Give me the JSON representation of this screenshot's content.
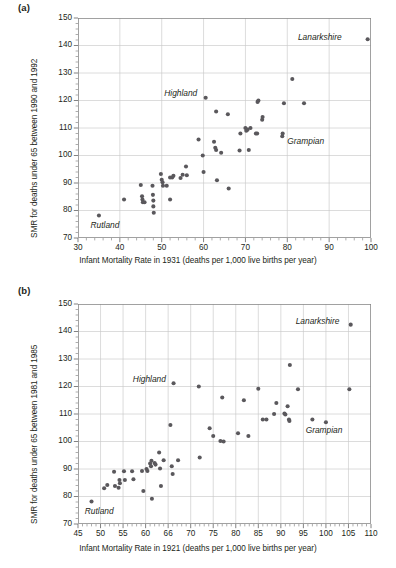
{
  "figure": {
    "panels": [
      {
        "key": "a",
        "label": "(a)",
        "xlabel": "Infant Mortality Rate in 1931 (deaths per 1,000 live births per year)",
        "ylabel": "SMR for deaths under 65 between 1990 and 1992",
        "xticks": [
          "30",
          "40",
          "50",
          "60",
          "70",
          "80",
          "90",
          "100"
        ],
        "yticks": [
          "70",
          "80",
          "90",
          "100",
          "110",
          "120",
          "130",
          "140",
          "150"
        ],
        "annotations": [
          {
            "text": "Lanarkshire"
          },
          {
            "text": "Highland"
          },
          {
            "text": "Grampian"
          },
          {
            "text": "Rutland"
          }
        ]
      },
      {
        "key": "b",
        "label": "(b)",
        "xlabel": "Infant Mortality Rate in 1921 (deaths per 1,000 live births per year)",
        "ylabel": "SMR for deaths under 65 between 1981 and 1985",
        "xticks": [
          "45",
          "50",
          "55",
          "60",
          "66",
          "70",
          "75",
          "80",
          "85",
          "90",
          "95",
          "100",
          "105",
          "110"
        ],
        "yticks": [
          "70",
          "80",
          "90",
          "100",
          "110",
          "120",
          "130",
          "140",
          "150"
        ],
        "annotations": [
          {
            "text": "Lanarkshire"
          },
          {
            "text": "Highland"
          },
          {
            "text": "Grampian"
          },
          {
            "text": "Rutland"
          }
        ]
      }
    ]
  },
  "chart_data": [
    {
      "type": "scatter",
      "panel": "a",
      "title": "(a)",
      "xlabel": "Infant Mortality Rate in 1931 (deaths per 1,000 live births per year)",
      "ylabel": "SMR for deaths under 65 between 1990 and 1992",
      "xlim": [
        30,
        100
      ],
      "ylim": [
        70,
        150
      ],
      "xtick_values": [
        30,
        40,
        50,
        60,
        70,
        80,
        90,
        100
      ],
      "xtick_labels": [
        "30",
        "40",
        "50",
        "60",
        "70",
        "80",
        "90",
        "100"
      ],
      "ytick_values": [
        70,
        80,
        90,
        100,
        110,
        120,
        130,
        140,
        150
      ],
      "ytick_labels": [
        "70",
        "80",
        "90",
        "100",
        "110",
        "120",
        "130",
        "140",
        "150"
      ],
      "x_minor_interval": 2,
      "y_minor_interval": 2,
      "grid": true,
      "legend": false,
      "marker_color": "#5a585c",
      "points": [
        [
          35.0,
          78.2
        ],
        [
          41.0,
          84.0
        ],
        [
          45.0,
          89.3
        ],
        [
          45.3,
          85.2
        ],
        [
          45.4,
          84.0
        ],
        [
          45.5,
          83.0
        ],
        [
          45.9,
          83.0
        ],
        [
          47.8,
          89.0
        ],
        [
          47.9,
          85.7
        ],
        [
          48.0,
          83.6
        ],
        [
          48.0,
          81.5
        ],
        [
          48.1,
          79.2
        ],
        [
          49.8,
          93.3
        ],
        [
          50.0,
          91.2
        ],
        [
          50.2,
          90.3
        ],
        [
          50.3,
          89.0
        ],
        [
          51.2,
          89.0
        ],
        [
          52.0,
          92.0
        ],
        [
          52.0,
          84.0
        ],
        [
          52.5,
          92.0
        ],
        [
          52.8,
          92.6
        ],
        [
          54.5,
          91.8
        ],
        [
          55.0,
          93.0
        ],
        [
          55.8,
          96.0
        ],
        [
          56.0,
          92.8
        ],
        [
          58.8,
          105.8
        ],
        [
          59.8,
          100.0
        ],
        [
          60.0,
          94.0
        ],
        [
          60.5,
          121.0
        ],
        [
          62.5,
          105.0
        ],
        [
          62.8,
          102.8
        ],
        [
          63.0,
          102.0
        ],
        [
          63.0,
          116.0
        ],
        [
          63.2,
          91.0
        ],
        [
          64.2,
          101.0
        ],
        [
          65.8,
          115.0
        ],
        [
          66.0,
          88.0
        ],
        [
          68.6,
          101.8
        ],
        [
          68.8,
          108.0
        ],
        [
          70.0,
          110.0
        ],
        [
          70.2,
          109.0
        ],
        [
          70.5,
          109.4
        ],
        [
          70.8,
          102.0
        ],
        [
          71.2,
          110.0
        ],
        [
          72.5,
          108.0
        ],
        [
          72.8,
          108.0
        ],
        [
          72.9,
          119.5
        ],
        [
          73.1,
          120.0
        ],
        [
          74.0,
          113.0
        ],
        [
          74.1,
          114.0
        ],
        [
          78.8,
          107.0
        ],
        [
          78.9,
          108.0
        ],
        [
          79.2,
          119.0
        ],
        [
          81.2,
          127.8
        ],
        [
          84.0,
          119.0
        ],
        [
          99.2,
          142.3
        ]
      ],
      "annotations": [
        {
          "text": "Lanarkshire",
          "x": 93.0,
          "y": 143.0,
          "anchor": "end"
        },
        {
          "text": "Highland",
          "x": 58.5,
          "y": 122.5,
          "anchor": "end"
        },
        {
          "text": "Grampian",
          "x": 80.0,
          "y": 105.0,
          "anchor": "start"
        },
        {
          "text": "Rutland",
          "x": 33.0,
          "y": 74.5,
          "anchor": "start"
        }
      ]
    },
    {
      "type": "scatter",
      "panel": "b",
      "title": "(b)",
      "xlabel": "Infant Mortality Rate in 1921 (deaths per 1,000 live births per year)",
      "ylabel": "SMR for deaths under 65 between 1981 and 1985",
      "xlim": [
        45,
        110
      ],
      "ylim": [
        70,
        150
      ],
      "xtick_values": [
        45,
        50,
        55,
        60,
        65,
        70,
        75,
        80,
        85,
        90,
        95,
        100,
        105,
        110
      ],
      "xtick_labels": [
        "45",
        "50",
        "55",
        "60",
        "66",
        "70",
        "75",
        "80",
        "85",
        "90",
        "95",
        "100",
        "105",
        "110"
      ],
      "ytick_values": [
        70,
        80,
        90,
        100,
        110,
        120,
        130,
        140,
        150
      ],
      "ytick_labels": [
        "70",
        "80",
        "90",
        "100",
        "110",
        "120",
        "130",
        "140",
        "150"
      ],
      "x_minor_interval": 1,
      "y_minor_interval": 2,
      "grid": true,
      "legend": false,
      "marker_color": "#5a585c",
      "points": [
        [
          48.0,
          78.2
        ],
        [
          50.8,
          83.0
        ],
        [
          51.5,
          84.2
        ],
        [
          53.0,
          89.0
        ],
        [
          53.2,
          83.8
        ],
        [
          54.0,
          83.2
        ],
        [
          54.2,
          86.0
        ],
        [
          54.3,
          84.8
        ],
        [
          55.2,
          89.2
        ],
        [
          55.4,
          86.0
        ],
        [
          57.0,
          89.2
        ],
        [
          57.3,
          86.3
        ],
        [
          59.2,
          89.3
        ],
        [
          59.5,
          82.0
        ],
        [
          60.2,
          90.0
        ],
        [
          60.4,
          89.3
        ],
        [
          61.0,
          92.0
        ],
        [
          61.2,
          91.0
        ],
        [
          61.3,
          93.0
        ],
        [
          61.4,
          79.2
        ],
        [
          62.0,
          92.2
        ],
        [
          62.2,
          91.6
        ],
        [
          63.0,
          96.0
        ],
        [
          63.2,
          90.2
        ],
        [
          63.4,
          83.8
        ],
        [
          64.0,
          93.2
        ],
        [
          65.5,
          106.0
        ],
        [
          65.8,
          91.0
        ],
        [
          66.0,
          88.2
        ],
        [
          66.2,
          121.2
        ],
        [
          67.2,
          93.2
        ],
        [
          71.8,
          120.0
        ],
        [
          72.0,
          94.2
        ],
        [
          74.2,
          104.8
        ],
        [
          75.0,
          102.0
        ],
        [
          76.6,
          100.2
        ],
        [
          77.0,
          116.0
        ],
        [
          77.3,
          100.0
        ],
        [
          80.5,
          103.0
        ],
        [
          81.8,
          115.0
        ],
        [
          82.8,
          102.0
        ],
        [
          85.0,
          119.2
        ],
        [
          86.0,
          108.0
        ],
        [
          86.8,
          108.0
        ],
        [
          88.5,
          110.0
        ],
        [
          89.0,
          114.0
        ],
        [
          90.8,
          110.2
        ],
        [
          91.0,
          109.8
        ],
        [
          91.5,
          112.8
        ],
        [
          91.8,
          108.0
        ],
        [
          91.9,
          107.5
        ],
        [
          92.0,
          127.8
        ],
        [
          93.8,
          119.0
        ],
        [
          97.0,
          108.0
        ],
        [
          100.0,
          107.0
        ],
        [
          105.2,
          119.0
        ],
        [
          105.5,
          142.5
        ]
      ],
      "annotations": [
        {
          "text": "Lanarkshire",
          "x": 103.0,
          "y": 143.5,
          "anchor": "end"
        },
        {
          "text": "Highland",
          "x": 64.5,
          "y": 122.5,
          "anchor": "end"
        },
        {
          "text": "Grampian",
          "x": 95.5,
          "y": 104.0,
          "anchor": "start"
        },
        {
          "text": "Rutland",
          "x": 46.5,
          "y": 74.5,
          "anchor": "start"
        }
      ]
    }
  ]
}
